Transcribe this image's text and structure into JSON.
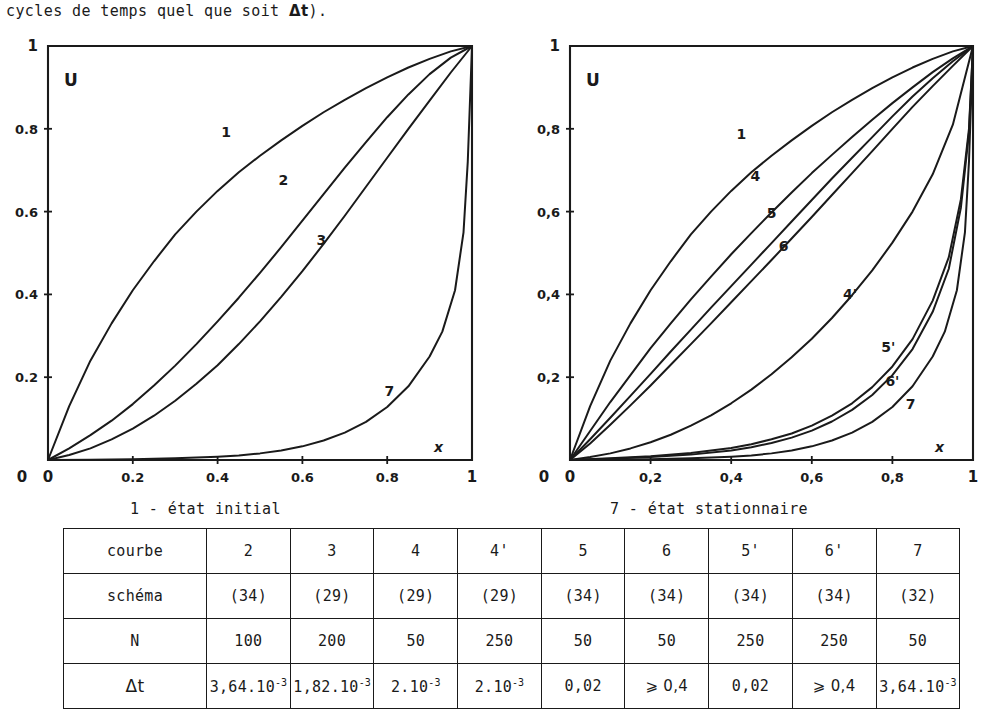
{
  "intro": {
    "text_before": "cycles de temps quel que soit ",
    "delta_t": "Δt",
    "text_after": ")."
  },
  "captions": {
    "left": "1 - état initial",
    "right": "7 - état stationnaire"
  },
  "chart_data": [
    {
      "type": "line",
      "id": "left-plot",
      "title": "",
      "xlabel": "x",
      "ylabel": "U",
      "xlim": [
        0,
        1
      ],
      "ylim": [
        0,
        1
      ],
      "grid": false,
      "legend": "inline-curve-labels",
      "xticks": [
        "0",
        "0.2",
        "0.4",
        "0.6",
        "0.8",
        "1"
      ],
      "xtick_values": [
        0,
        0.2,
        0.4,
        0.6,
        0.8,
        1
      ],
      "yticks": [
        "0",
        "0.2",
        "0.4",
        "0.6",
        "0.8",
        "1"
      ],
      "ytick_values": [
        0,
        0.2,
        0.4,
        0.6,
        0.8,
        1
      ],
      "series": [
        {
          "name": "1",
          "label_x": 0.42,
          "label_y": 0.78,
          "x": [
            0,
            0.05,
            0.1,
            0.15,
            0.2,
            0.25,
            0.3,
            0.35,
            0.4,
            0.45,
            0.5,
            0.55,
            0.6,
            0.65,
            0.7,
            0.75,
            0.8,
            0.85,
            0.9,
            0.95,
            1
          ],
          "y": [
            0,
            0.13,
            0.24,
            0.33,
            0.41,
            0.48,
            0.545,
            0.6,
            0.65,
            0.695,
            0.735,
            0.772,
            0.807,
            0.84,
            0.87,
            0.898,
            0.924,
            0.948,
            0.969,
            0.987,
            1
          ]
        },
        {
          "name": "2",
          "label_x": 0.555,
          "label_y": 0.665,
          "x": [
            0,
            0.05,
            0.1,
            0.15,
            0.2,
            0.25,
            0.3,
            0.35,
            0.4,
            0.45,
            0.5,
            0.55,
            0.6,
            0.65,
            0.7,
            0.75,
            0.8,
            0.85,
            0.9,
            0.95,
            1
          ],
          "y": [
            0,
            0.028,
            0.06,
            0.095,
            0.135,
            0.18,
            0.228,
            0.28,
            0.335,
            0.392,
            0.452,
            0.514,
            0.578,
            0.642,
            0.706,
            0.768,
            0.828,
            0.883,
            0.932,
            0.972,
            1
          ]
        },
        {
          "name": "3",
          "label_x": 0.645,
          "label_y": 0.52,
          "x": [
            0,
            0.05,
            0.1,
            0.15,
            0.2,
            0.25,
            0.3,
            0.35,
            0.4,
            0.45,
            0.5,
            0.55,
            0.6,
            0.65,
            0.7,
            0.75,
            0.8,
            0.85,
            0.9,
            0.95,
            1
          ],
          "y": [
            0,
            0.012,
            0.028,
            0.05,
            0.076,
            0.107,
            0.143,
            0.184,
            0.229,
            0.28,
            0.335,
            0.394,
            0.456,
            0.522,
            0.59,
            0.66,
            0.73,
            0.8,
            0.868,
            0.936,
            1
          ]
        },
        {
          "name": "7",
          "label_x": 0.805,
          "label_y": 0.155,
          "x": [
            0,
            0.1,
            0.2,
            0.3,
            0.4,
            0.45,
            0.5,
            0.55,
            0.6,
            0.65,
            0.7,
            0.75,
            0.8,
            0.85,
            0.9,
            0.93,
            0.96,
            0.98,
            0.99,
            1
          ],
          "y": [
            0,
            0.0008,
            0.002,
            0.004,
            0.008,
            0.011,
            0.016,
            0.023,
            0.033,
            0.047,
            0.066,
            0.092,
            0.128,
            0.178,
            0.25,
            0.31,
            0.41,
            0.55,
            0.72,
            1
          ]
        }
      ]
    },
    {
      "type": "line",
      "id": "right-plot",
      "title": "",
      "xlabel": "x",
      "ylabel": "U",
      "xlim": [
        0,
        1
      ],
      "ylim": [
        0,
        1
      ],
      "grid": false,
      "legend": "inline-curve-labels",
      "xticks": [
        "0",
        "0,2",
        "0,4",
        "0,6",
        "0,8",
        "1"
      ],
      "xtick_values": [
        0,
        0.2,
        0.4,
        0.6,
        0.8,
        1
      ],
      "yticks": [
        "0",
        "0,2",
        "0,4",
        "0,6",
        "0,8",
        "1"
      ],
      "ytick_values": [
        0,
        0.2,
        0.4,
        0.6,
        0.8,
        1
      ],
      "series": [
        {
          "name": "1",
          "label_x": 0.425,
          "label_y": 0.775,
          "x": [
            0,
            0.05,
            0.1,
            0.15,
            0.2,
            0.25,
            0.3,
            0.35,
            0.4,
            0.45,
            0.5,
            0.55,
            0.6,
            0.65,
            0.7,
            0.75,
            0.8,
            0.85,
            0.9,
            0.95,
            1
          ],
          "y": [
            0,
            0.13,
            0.24,
            0.33,
            0.41,
            0.48,
            0.545,
            0.6,
            0.65,
            0.695,
            0.735,
            0.772,
            0.807,
            0.84,
            0.87,
            0.898,
            0.924,
            0.948,
            0.969,
            0.987,
            1
          ]
        },
        {
          "name": "4",
          "label_x": 0.46,
          "label_y": 0.675,
          "x": [
            0,
            0.05,
            0.1,
            0.15,
            0.2,
            0.25,
            0.3,
            0.35,
            0.4,
            0.45,
            0.5,
            0.55,
            0.6,
            0.65,
            0.7,
            0.75,
            0.8,
            0.85,
            0.9,
            0.95,
            1
          ],
          "y": [
            0,
            0.07,
            0.14,
            0.205,
            0.27,
            0.33,
            0.388,
            0.443,
            0.497,
            0.548,
            0.598,
            0.646,
            0.693,
            0.737,
            0.78,
            0.822,
            0.862,
            0.9,
            0.937,
            0.97,
            1
          ]
        },
        {
          "name": "5",
          "label_x": 0.5,
          "label_y": 0.585,
          "x": [
            0,
            0.05,
            0.1,
            0.15,
            0.2,
            0.25,
            0.3,
            0.35,
            0.4,
            0.45,
            0.5,
            0.55,
            0.6,
            0.65,
            0.7,
            0.75,
            0.8,
            0.85,
            0.9,
            0.95,
            1
          ],
          "y": [
            0,
            0.05,
            0.102,
            0.155,
            0.208,
            0.262,
            0.315,
            0.368,
            0.42,
            0.472,
            0.524,
            0.576,
            0.628,
            0.68,
            0.73,
            0.78,
            0.83,
            0.878,
            0.922,
            0.963,
            1
          ]
        },
        {
          "name": "6",
          "label_x": 0.53,
          "label_y": 0.505,
          "x": [
            0,
            0.05,
            0.1,
            0.15,
            0.2,
            0.25,
            0.3,
            0.35,
            0.4,
            0.45,
            0.5,
            0.55,
            0.6,
            0.65,
            0.7,
            0.75,
            0.8,
            0.85,
            0.9,
            0.95,
            1
          ],
          "y": [
            0,
            0.04,
            0.085,
            0.132,
            0.18,
            0.23,
            0.28,
            0.33,
            0.381,
            0.432,
            0.483,
            0.535,
            0.587,
            0.64,
            0.693,
            0.746,
            0.8,
            0.853,
            0.903,
            0.952,
            1
          ]
        },
        {
          "name": "4'",
          "label_x": 0.695,
          "label_y": 0.39,
          "x": [
            0,
            0.05,
            0.1,
            0.15,
            0.2,
            0.25,
            0.3,
            0.35,
            0.4,
            0.45,
            0.5,
            0.55,
            0.6,
            0.65,
            0.7,
            0.75,
            0.8,
            0.85,
            0.9,
            0.95,
            1
          ],
          "y": [
            0,
            0.007,
            0.016,
            0.028,
            0.043,
            0.061,
            0.083,
            0.108,
            0.137,
            0.17,
            0.207,
            0.248,
            0.293,
            0.343,
            0.398,
            0.458,
            0.525,
            0.6,
            0.69,
            0.81,
            1
          ]
        },
        {
          "name": "5'",
          "label_x": 0.79,
          "label_y": 0.262,
          "x": [
            0,
            0.1,
            0.2,
            0.3,
            0.4,
            0.45,
            0.5,
            0.55,
            0.6,
            0.65,
            0.7,
            0.75,
            0.8,
            0.85,
            0.9,
            0.94,
            0.97,
            0.99,
            1
          ],
          "y": [
            0,
            0.004,
            0.009,
            0.017,
            0.029,
            0.038,
            0.05,
            0.064,
            0.083,
            0.107,
            0.137,
            0.176,
            0.226,
            0.292,
            0.385,
            0.49,
            0.63,
            0.8,
            1
          ]
        },
        {
          "name": "6'",
          "label_x": 0.8,
          "label_y": 0.178,
          "x": [
            0,
            0.1,
            0.2,
            0.3,
            0.4,
            0.45,
            0.5,
            0.55,
            0.6,
            0.65,
            0.7,
            0.75,
            0.8,
            0.85,
            0.9,
            0.94,
            0.97,
            0.99,
            1
          ],
          "y": [
            0,
            0.003,
            0.007,
            0.013,
            0.023,
            0.031,
            0.041,
            0.054,
            0.071,
            0.093,
            0.121,
            0.157,
            0.205,
            0.268,
            0.358,
            0.462,
            0.61,
            0.79,
            1
          ]
        },
        {
          "name": "7",
          "label_x": 0.845,
          "label_y": 0.122,
          "x": [
            0,
            0.1,
            0.2,
            0.3,
            0.4,
            0.45,
            0.5,
            0.55,
            0.6,
            0.65,
            0.7,
            0.75,
            0.8,
            0.85,
            0.9,
            0.93,
            0.96,
            0.98,
            0.99,
            1
          ],
          "y": [
            0,
            0.0008,
            0.002,
            0.004,
            0.008,
            0.011,
            0.016,
            0.023,
            0.033,
            0.047,
            0.066,
            0.092,
            0.128,
            0.178,
            0.25,
            0.31,
            0.41,
            0.55,
            0.72,
            1
          ]
        }
      ]
    }
  ],
  "table": {
    "rows": [
      {
        "header": "courbe",
        "cells": [
          "2",
          "3",
          "4",
          "4'",
          "5",
          "6",
          "5'",
          "6'",
          "7"
        ]
      },
      {
        "header": "schéma",
        "cells": [
          "(34)",
          "(29)",
          "(29)",
          "(29)",
          "(34)",
          "(34)",
          "(34)",
          "(34)",
          "(32)"
        ]
      },
      {
        "header": "N",
        "cells": [
          "100",
          "200",
          "50",
          "250",
          "50",
          "50",
          "250",
          "250",
          "50"
        ]
      },
      {
        "header": "Δt",
        "cells": [
          {
            "mantissa": "3,64.10",
            "exp": "-3"
          },
          {
            "mantissa": "1,82.10",
            "exp": "-3"
          },
          {
            "mantissa": "2.10",
            "exp": "-3"
          },
          {
            "mantissa": "2.10",
            "exp": "-3"
          },
          {
            "mantissa": "0,02",
            "exp": ""
          },
          {
            "mantissa": "⩾ 0,4",
            "exp": ""
          },
          {
            "mantissa": "0,02",
            "exp": ""
          },
          {
            "mantissa": "⩾ 0,4",
            "exp": ""
          },
          {
            "mantissa": "3,64.10",
            "exp": "-3"
          }
        ]
      }
    ]
  }
}
